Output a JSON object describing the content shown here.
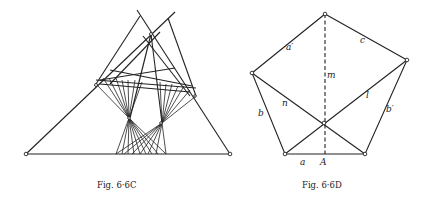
{
  "figures": [
    {
      "id": "left",
      "caption": "Fig. 6·6C"
    },
    {
      "id": "right",
      "caption": "Fig. 6·6D",
      "labels": {
        "a_prime": "a′",
        "c": "c",
        "m": "m",
        "n": "n",
        "l": "l",
        "b": "b",
        "b_prime": "b′",
        "a": "a",
        "A": "A"
      }
    }
  ]
}
